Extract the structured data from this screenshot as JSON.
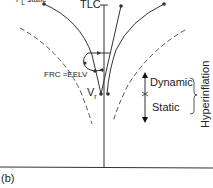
{
  "diagram": {
    "panel_label": "(b)",
    "top_labels": {
      "left": "P",
      "left_sub": "L",
      "left_suffix": " static",
      "center": "TLC",
      "right1": "V",
      "right2": "Z"
    },
    "labels": {
      "frc": "FRC",
      "equals": "=",
      "eelv": "EELV",
      "vr": "V",
      "vr_sub": "r",
      "dynamic": "Dynamic",
      "static": "Static",
      "hyperinflation": "Hyperinflation"
    },
    "colors": {
      "line": "#333333",
      "dashed": "#555555",
      "background": "#ffffff"
    }
  }
}
